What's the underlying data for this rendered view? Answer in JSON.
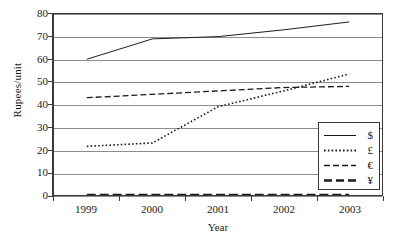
{
  "chart_data": {
    "type": "line",
    "title": "",
    "xlabel": "Year",
    "ylabel": "Rupees/unit",
    "categories": [
      "1999",
      "2000",
      "2001",
      "2002",
      "2003"
    ],
    "ylim": [
      0,
      80
    ],
    "yticks": [
      0,
      10,
      20,
      30,
      40,
      50,
      60,
      70,
      80
    ],
    "grid": "horizontal",
    "legend_position": "inside-bottom-right",
    "series": [
      {
        "name": "$",
        "style": "solid",
        "values": [
          60,
          69,
          70,
          73,
          76.5
        ]
      },
      {
        "name": "£",
        "style": "dotted",
        "values": [
          21.5,
          23,
          39,
          46,
          53.5
        ]
      },
      {
        "name": "€",
        "style": "dashed",
        "values": [
          43,
          44.5,
          46,
          47.5,
          48
        ]
      },
      {
        "name": "¥",
        "style": "bold-dashed",
        "values": [
          0,
          0,
          0,
          0,
          0
        ]
      }
    ]
  },
  "axes": {
    "y_title": "Rupees/unit",
    "x_title": "Year",
    "y_tick_labels": [
      "80",
      "70",
      "60",
      "50",
      "40",
      "30",
      "20",
      "10",
      "0"
    ],
    "x_tick_labels": [
      "1999",
      "2000",
      "2001",
      "2002",
      "2003"
    ]
  },
  "legend": {
    "items": [
      {
        "label": "$"
      },
      {
        "label": "£"
      },
      {
        "label": "€"
      },
      {
        "label": "¥"
      }
    ]
  },
  "colors": {
    "line": "#1a1a1a",
    "grid": "#8c8c8c",
    "frame": "#3a3a3a",
    "background": "#ffffff"
  }
}
